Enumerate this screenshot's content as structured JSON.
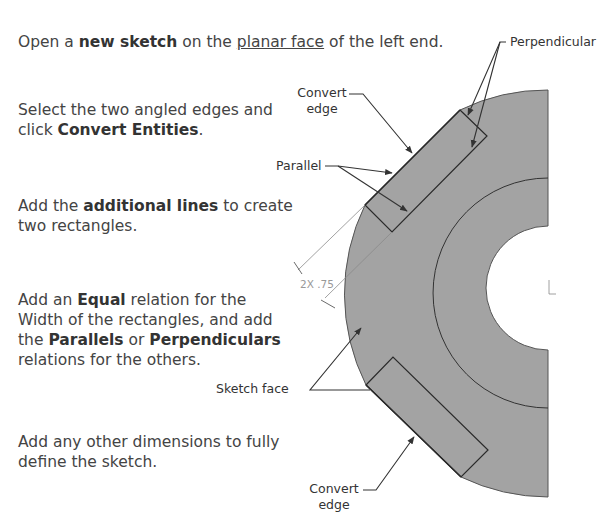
{
  "instructions": {
    "step1": {
      "pre": "Open a ",
      "bold": "new sketch",
      "mid": " on the ",
      "underline": "planar face",
      "post": " of the left end."
    },
    "step2": {
      "line1": "Select the two angled edges and",
      "line2_pre": "click ",
      "line2_bold": "Convert Entities",
      "line2_post": "."
    },
    "step3": {
      "pre": "Add the ",
      "bold": "additional lines",
      "post": " to create",
      "line2": "two rectangles."
    },
    "step4": {
      "pre": "Add an ",
      "bold1": "Equal",
      "post1": " relation for the",
      "line2": "Width of the rectangles, and add",
      "line3_pre": "the ",
      "bold2": "Parallels",
      "mid": " or ",
      "bold3": "Perpendiculars",
      "line4": "relations for the others."
    },
    "step5": {
      "line1": "Add any other dimensions to fully",
      "line2": "define the sketch."
    }
  },
  "callouts": {
    "perpendicular": "Perpendicular",
    "convert_edge_top_l1": "Convert",
    "convert_edge_top_l2": "edge",
    "parallel": "Parallel",
    "sketch_face": "Sketch face",
    "convert_edge_bottom_l1": "Convert",
    "convert_edge_bottom_l2": "edge",
    "dimension": "2X .75"
  },
  "colors": {
    "face": "#a3a3a3",
    "edge": "#2e2e2e",
    "text": "#444444",
    "dim": "#9a9a9a"
  }
}
